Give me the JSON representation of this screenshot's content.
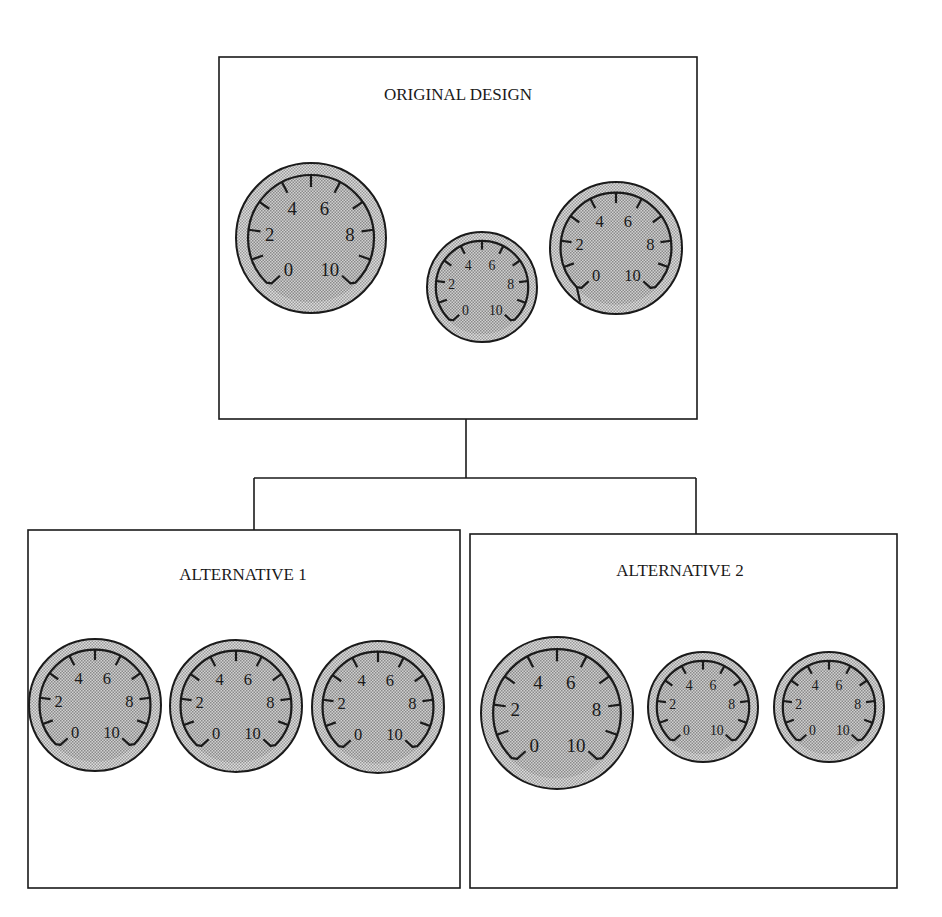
{
  "diagram": {
    "colors": {
      "line": "#1a1a1a",
      "gauge_face": "#b8b8b8",
      "gauge_rim": "#c8c8c8",
      "background": "#ffffff"
    },
    "gauge_scale_labels": [
      "0",
      "2",
      "4",
      "6",
      "8",
      "10"
    ],
    "boxes": [
      {
        "id": "original",
        "title": "ORIGINAL DESIGN",
        "rect": [
          219,
          57,
          478,
          362
        ],
        "title_pos": [
          458,
          100
        ],
        "gauges": [
          {
            "cx": 311,
            "cy": 238,
            "r": 75
          },
          {
            "cx": 482,
            "cy": 287,
            "r": 55
          },
          {
            "cx": 616,
            "cy": 248,
            "r": 66,
            "variant": "notched"
          }
        ]
      },
      {
        "id": "alternative-1",
        "title": "ALTERNATIVE 1",
        "rect": [
          28,
          530,
          432,
          358
        ],
        "title_pos": [
          243,
          580
        ],
        "gauges": [
          {
            "cx": 95,
            "cy": 705,
            "r": 66
          },
          {
            "cx": 236,
            "cy": 706,
            "r": 66
          },
          {
            "cx": 378,
            "cy": 707,
            "r": 66
          }
        ]
      },
      {
        "id": "alternative-2",
        "title": "ALTERNATIVE 2",
        "rect": [
          470,
          534,
          427,
          354
        ],
        "title_pos": [
          680,
          576
        ],
        "gauges": [
          {
            "cx": 557,
            "cy": 713,
            "r": 76
          },
          {
            "cx": 703,
            "cy": 707,
            "r": 55
          },
          {
            "cx": 829,
            "cy": 707,
            "r": 55
          }
        ]
      }
    ],
    "connectors": [
      [
        [
          466,
          419
        ],
        [
          466,
          478
        ]
      ],
      [
        [
          254,
          478
        ],
        [
          696,
          478
        ]
      ],
      [
        [
          254,
          478
        ],
        [
          254,
          530
        ]
      ],
      [
        [
          696,
          478
        ],
        [
          696,
          534
        ]
      ]
    ]
  }
}
